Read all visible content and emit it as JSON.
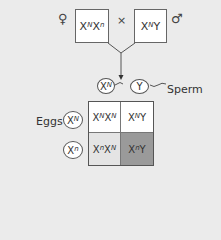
{
  "parents": {
    "female_symbol": "♀",
    "female_genotype": {
      "base": "X",
      "sup1": "N",
      "base2": "X",
      "sup2": "n"
    },
    "cross_symbol": "×",
    "male_genotype": {
      "base": "X",
      "sup1": "N",
      "base2": "Y"
    },
    "male_symbol": "♂"
  },
  "sperm": {
    "label": "Sperm",
    "gametes": [
      {
        "base": "X",
        "sup": "N"
      },
      {
        "base": "Y",
        "sup": ""
      }
    ]
  },
  "eggs": {
    "label": "Eggs",
    "gametes": [
      {
        "base": "X",
        "sup": "N"
      },
      {
        "base": "X",
        "sup": "n"
      }
    ]
  },
  "punnett": {
    "cells": [
      {
        "a": "X",
        "as": "N",
        "b": "X",
        "bs": "N",
        "color": "#ffffff"
      },
      {
        "a": "X",
        "as": "N",
        "b": "Y",
        "bs": "",
        "color": "#ffffff"
      },
      {
        "a": "X",
        "as": "n",
        "b": "X",
        "bs": "N",
        "color": "#e4e4e4"
      },
      {
        "a": "X",
        "as": "n",
        "b": "Y",
        "bs": "",
        "color": "#9a9a9a"
      }
    ]
  }
}
